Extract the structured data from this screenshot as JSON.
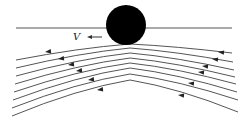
{
  "diagram": {
    "velocity_label": "V",
    "colors": {
      "ball": "#000000",
      "lines": "#555555",
      "background": "#ffffff"
    },
    "ball": {
      "cx": 126,
      "cy": 25,
      "r": 20
    },
    "surface": {
      "x1": 16,
      "y1": 28,
      "x2": 232,
      "y2": 28
    },
    "velocity_arrow": {
      "x1": 102,
      "y1": 37,
      "x2": 87,
      "y2": 37
    },
    "streamlines": [
      {
        "left": [
          16,
          60
        ],
        "peak": [
          130,
          44
        ],
        "right": [
          232,
          53
        ]
      },
      {
        "left": [
          16,
          68
        ],
        "peak": [
          130,
          48
        ],
        "right": [
          233,
          62
        ]
      },
      {
        "left": [
          16,
          76
        ],
        "peak": [
          130,
          53
        ],
        "right": [
          234,
          70
        ]
      },
      {
        "left": [
          15,
          84
        ],
        "peak": [
          130,
          58
        ],
        "right": [
          235,
          77
        ]
      },
      {
        "left": [
          14,
          92
        ],
        "peak": [
          130,
          63
        ],
        "right": [
          236,
          84
        ]
      },
      {
        "left": [
          13,
          100
        ],
        "peak": [
          130,
          68
        ],
        "right": [
          237,
          92
        ]
      },
      {
        "left": [
          12,
          108
        ],
        "peak": [
          130,
          74
        ],
        "right": [
          238,
          100
        ]
      },
      {
        "left": [
          12,
          116
        ],
        "peak": [
          130,
          80
        ],
        "right": [
          238,
          112
        ]
      }
    ],
    "arrows_left": [
      [
        45,
        52
      ],
      [
        58,
        59
      ],
      [
        68,
        65
      ],
      [
        76,
        71
      ],
      [
        88,
        80
      ],
      [
        97,
        90
      ]
    ],
    "arrows_right": [
      [
        218,
        52
      ],
      [
        212,
        59
      ],
      [
        202,
        66
      ],
      [
        198,
        72
      ],
      [
        188,
        83
      ],
      [
        178,
        95
      ]
    ]
  }
}
